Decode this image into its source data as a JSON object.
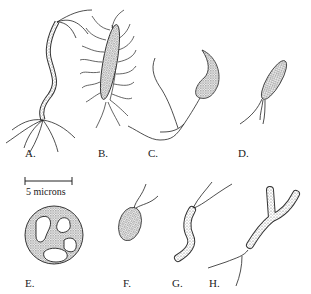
{
  "figure": {
    "labels": [
      "A.",
      "B.",
      "C.",
      "D.",
      "E.",
      "F.",
      "G.",
      "H."
    ],
    "scale_bar": {
      "text": "5 microns"
    },
    "organisms": [
      {
        "id": "A",
        "description": "long wavy spiral bacterium with polar flagella tufts at both ends"
      },
      {
        "id": "B",
        "description": "rod-shaped peritrichous bacterium with many flagella"
      },
      {
        "id": "C",
        "description": "curved comma-shaped bacterium with long single flagellum"
      },
      {
        "id": "D",
        "description": "small rod with tuft of polar flagella"
      },
      {
        "id": "E",
        "description": "round coccoid cell with irregular inclusions"
      },
      {
        "id": "F",
        "description": "oval cell with two polar flagella"
      },
      {
        "id": "G",
        "description": "curved S-shaped cell with two flagella"
      },
      {
        "id": "H",
        "description": "branched Y-shaped cell with flagellum"
      }
    ]
  }
}
